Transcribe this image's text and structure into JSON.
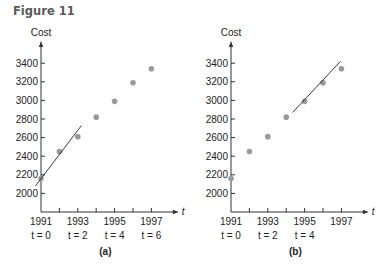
{
  "figure": {
    "title": "Figure 11"
  },
  "colors": {
    "point": "#9a9a9a",
    "axis": "#333333",
    "line": "#222222",
    "text": "#222222"
  },
  "chart_data": [
    {
      "type": "scatter",
      "panel_label": "(a)",
      "ylabel": "Cost",
      "xlabel": "t",
      "x": [
        1991,
        1992,
        1993,
        1994,
        1995,
        1996,
        1997
      ],
      "t": [
        0,
        1,
        2,
        3,
        4,
        5,
        6
      ],
      "values": [
        2160,
        2450,
        2610,
        2820,
        2990,
        3190,
        3340
      ],
      "yticks": [
        2000,
        2200,
        2400,
        2600,
        2800,
        3000,
        3200,
        3400
      ],
      "xtick_labels": [
        {
          "year": "1991",
          "t": "t = 0",
          "x": 1991
        },
        {
          "year": "1993",
          "t": "t = 2",
          "x": 1993
        },
        {
          "year": "1995",
          "t": "t = 4",
          "x": 1995
        },
        {
          "year": "1997",
          "t": "t = 6",
          "x": 1997
        }
      ],
      "ylim": [
        1800,
        3600
      ],
      "xlim": [
        1991,
        1998
      ],
      "fit_line": {
        "x1": 1990.7,
        "y1": 2080,
        "x2": 1993.2,
        "y2": 2730
      },
      "origin_px": {
        "x": 41,
        "y": 212
      }
    },
    {
      "type": "scatter",
      "panel_label": "(b)",
      "ylabel": "Cost",
      "xlabel": "t",
      "x": [
        1991,
        1992,
        1993,
        1994,
        1995,
        1996,
        1997
      ],
      "t": [
        0,
        1,
        2,
        3,
        4,
        5,
        6
      ],
      "values": [
        2160,
        2450,
        2610,
        2820,
        2990,
        3190,
        3340
      ],
      "yticks": [
        2000,
        2200,
        2400,
        2600,
        2800,
        3000,
        3200,
        3400
      ],
      "xtick_labels": [
        {
          "year": "1991",
          "t": "t = 0",
          "x": 1991
        },
        {
          "year": "1993",
          "t": "t = 2",
          "x": 1993
        },
        {
          "year": "1995",
          "t": "t = 4",
          "x": 1995
        },
        {
          "year": "1997",
          "t": "",
          "x": 1997
        }
      ],
      "ylim": [
        1800,
        3600
      ],
      "xlim": [
        1991,
        1998
      ],
      "fit_line": {
        "x1": 1994.35,
        "y1": 2870,
        "x2": 1996.95,
        "y2": 3420
      },
      "origin_px": {
        "x": 231,
        "y": 212
      }
    }
  ]
}
